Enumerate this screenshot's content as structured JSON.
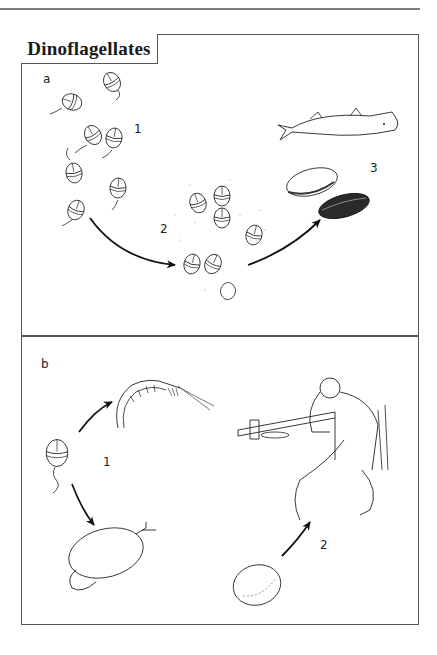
{
  "figure": {
    "title": "Dinoflagellates",
    "panel_a": {
      "label": "a",
      "steps": [
        {
          "number": "1",
          "depicts": "free-swimming dinoflagellates with flagella"
        },
        {
          "number": "2",
          "depicts": "bloom / release of toxins from dinoflagellate cells"
        },
        {
          "number": "3",
          "depicts": "fish and shellfish (clam, mussel) accumulate toxins"
        }
      ]
    },
    "panel_b": {
      "label": "b",
      "steps": [
        {
          "number": "1",
          "depicts": "dinoflagellate eaten by zooplankton (shrimp) and filter-feeding clam"
        },
        {
          "number": "2",
          "depicts": "human eats contaminated shellfish and becomes ill"
        }
      ]
    }
  }
}
